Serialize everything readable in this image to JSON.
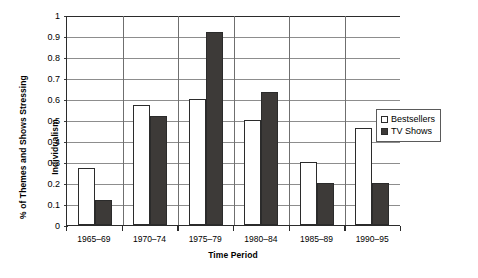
{
  "chart_data": {
    "type": "bar",
    "title": "",
    "xlabel": "Time Period",
    "ylabel_line1": "% of Themes and Shows Stressing",
    "ylabel_line2": "Individualism",
    "categories": [
      "1965–69",
      "1970–74",
      "1975–79",
      "1980–84",
      "1985–89",
      "1990–95"
    ],
    "series": [
      {
        "name": "Bestsellers",
        "color": "#ffffff",
        "values": [
          0.27,
          0.57,
          0.6,
          0.5,
          0.3,
          0.46
        ]
      },
      {
        "name": "TV Shows",
        "color": "#3d3a38",
        "values": [
          0.12,
          0.52,
          0.92,
          0.635,
          0.2,
          0.2
        ]
      }
    ],
    "ylim": [
      0,
      1
    ],
    "yticks": [
      0,
      0.1,
      0.2,
      0.3,
      0.4,
      0.5,
      0.6,
      0.7,
      0.8,
      0.9,
      1
    ],
    "ytick_labels": [
      "0",
      "0.1",
      "0.2",
      "0.3",
      "0.4",
      "0.5",
      "0.6",
      "0.7",
      "0.8",
      "0.9",
      "1"
    ],
    "grid": true,
    "grid_axis": "y",
    "legend_position": "right"
  },
  "legend": {
    "items": [
      {
        "label": "Bestsellers",
        "swatch": "hollow-square-icon"
      },
      {
        "label": "TV Shows",
        "swatch": "filled-square-icon"
      }
    ]
  }
}
